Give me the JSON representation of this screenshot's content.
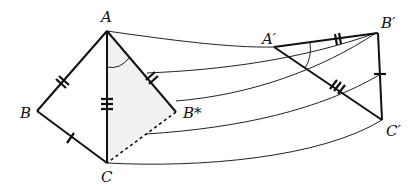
{
  "diagram": {
    "labels": {
      "A": "A",
      "B": "B",
      "C": "C",
      "B_star": "B*",
      "A_prime": "A′",
      "B_prime": "B′",
      "C_prime": "C′"
    },
    "colors": {
      "stroke": "#111111",
      "shade": "#f1f1f1",
      "background": "#ffffff"
    },
    "tick_marks": {
      "AB": 2,
      "BC": 1,
      "AC": 3,
      "AB_star": 2,
      "A_prime_B_prime": 2,
      "B_prime_C_prime": 1,
      "A_prime_C_prime": 3
    },
    "flow_curves": 5
  }
}
